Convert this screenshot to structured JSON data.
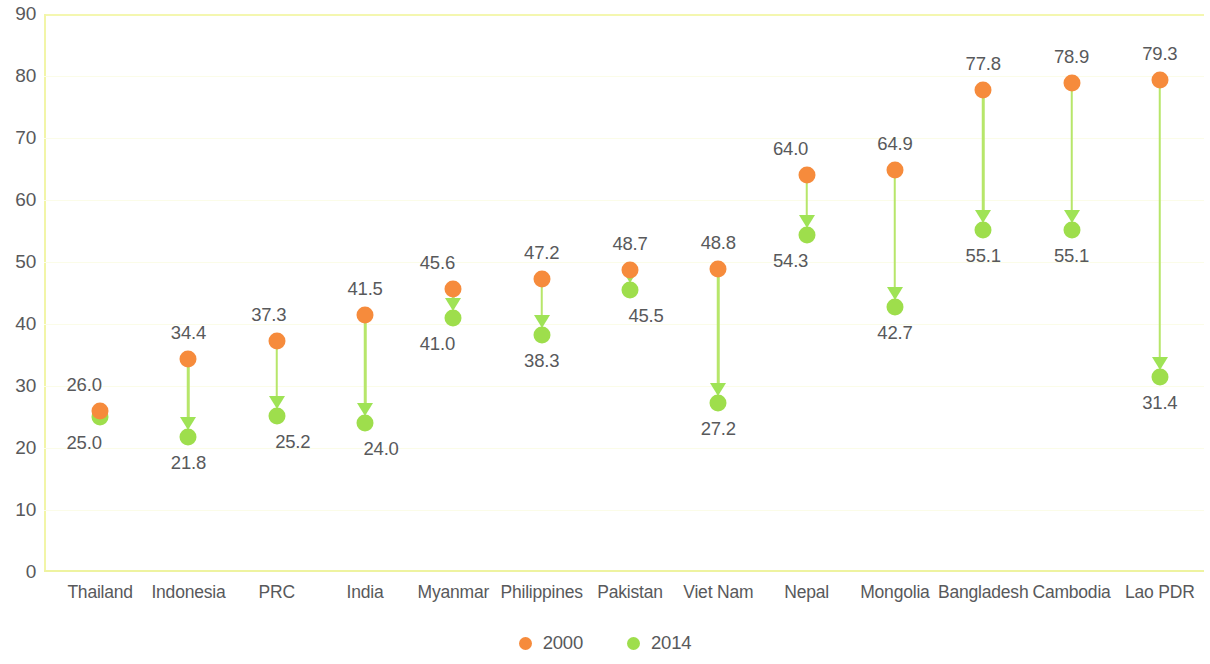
{
  "chart_data": {
    "type": "scatter",
    "title": "",
    "subtitle": "",
    "xlabel": "",
    "ylabel": "",
    "ylim": [
      0,
      90
    ],
    "ytick_step": 10,
    "yticks": [
      "0",
      "10",
      "20",
      "30",
      "40",
      "50",
      "60",
      "70",
      "80",
      "90"
    ],
    "grid": true,
    "legend_position": "bottom-center",
    "categories": [
      "Thailand",
      "Indonesia",
      "PRC",
      "India",
      "Myanmar",
      "Philippines",
      "Pakistan",
      "Viet Nam",
      "Nepal",
      "Mongolia",
      "Bangladesh",
      "Cambodia",
      "Lao PDR"
    ],
    "series": [
      {
        "name": "2000",
        "color": "#f68b3c",
        "values": [
          26.0,
          34.4,
          37.3,
          41.5,
          45.6,
          47.2,
          48.7,
          48.8,
          64.0,
          64.9,
          77.8,
          78.9,
          79.3
        ],
        "labels": [
          "26.0",
          "34.4",
          "37.3",
          "41.5",
          "45.6",
          "47.2",
          "48.7",
          "48.8",
          "64.0",
          "64.9",
          "77.8",
          "78.9",
          "79.3"
        ]
      },
      {
        "name": "2014",
        "color": "#9ede4c",
        "values": [
          25.0,
          21.8,
          25.2,
          24.0,
          41.0,
          38.3,
          45.5,
          27.2,
          54.3,
          42.7,
          55.1,
          55.1,
          31.4
        ],
        "labels": [
          "25.0",
          "21.8",
          "25.2",
          "24.0",
          "41.0",
          "38.3",
          "45.5",
          "27.2",
          "54.3",
          "42.7",
          "55.1",
          "55.1",
          "31.4"
        ]
      }
    ],
    "connector_color": "#b7e66a",
    "arrow_direction": "down",
    "axis_color": "#f2f5a8",
    "gridline_color": "#fbfce8",
    "text_color": "#58595b",
    "label_offsets": {
      "top_label_dy": -26,
      "bottom_label_dy": 26,
      "top_label_dx": [
        -16,
        0,
        -8,
        0,
        -16,
        0,
        0,
        0,
        -16,
        0,
        0,
        0,
        0
      ],
      "bottom_label_dx": [
        -16,
        0,
        16,
        16,
        -16,
        0,
        16,
        0,
        -16,
        0,
        0,
        0,
        0
      ]
    }
  },
  "legend": {
    "items": [
      {
        "label": "2000",
        "color": "#f68b3c"
      },
      {
        "label": "2014",
        "color": "#9ede4c"
      }
    ]
  }
}
